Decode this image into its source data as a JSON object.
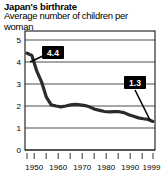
{
  "title": "Japan's birthrate",
  "subtitle": "Average number of children per woman",
  "chart_data": {
    "type": "line",
    "title": "Japan's birthrate",
    "subtitle": "Average number of children per woman",
    "xlabel": "",
    "ylabel": "",
    "xlim": [
      1946,
      2000
    ],
    "ylim": [
      0,
      5.4
    ],
    "grid": true,
    "legend": null,
    "y_ticks": [
      "5",
      "4",
      "3",
      "2",
      "1",
      "0"
    ],
    "y_tick_values": [
      5,
      4,
      3,
      2,
      1,
      0
    ],
    "x_ticks": [
      "1950",
      "1960",
      "1970",
      "1980",
      "1990",
      "1999"
    ],
    "x_tick_values": [
      1950,
      1960,
      1970,
      1980,
      1990,
      1999
    ],
    "x_minor_ticks": [
      1947,
      1950,
      1955,
      1960,
      1965,
      1970,
      1975,
      1980,
      1985,
      1990,
      1995,
      1999
    ],
    "x": [
      1947,
      1949,
      1951,
      1953,
      1955,
      1957,
      1959,
      1961,
      1963,
      1965,
      1967,
      1969,
      1971,
      1973,
      1975,
      1977,
      1979,
      1981,
      1983,
      1985,
      1987,
      1989,
      1991,
      1993,
      1995,
      1997,
      1999
    ],
    "values": [
      4.4,
      4.3,
      3.6,
      3.1,
      2.4,
      2.05,
      2.0,
      1.96,
      2.0,
      2.05,
      2.07,
      2.05,
      2.02,
      1.95,
      1.85,
      1.8,
      1.75,
      1.73,
      1.74,
      1.74,
      1.7,
      1.6,
      1.53,
      1.46,
      1.42,
      1.39,
      1.3
    ],
    "series": [
      {
        "name": "Japan total fertility rate",
        "values": [
          4.4,
          4.3,
          3.6,
          3.1,
          2.4,
          2.05,
          2.0,
          1.96,
          2.0,
          2.05,
          2.07,
          2.05,
          2.02,
          1.95,
          1.85,
          1.8,
          1.75,
          1.73,
          1.74,
          1.74,
          1.7,
          1.6,
          1.53,
          1.46,
          1.42,
          1.39,
          1.3
        ],
        "color": "#2b2b2b"
      }
    ],
    "annotations": [
      {
        "label": "4.4",
        "x": 1947,
        "y": 4.4
      },
      {
        "label": "1.3",
        "x": 1999,
        "y": 1.3
      }
    ]
  },
  "callouts": {
    "start": "4.4",
    "end": "1.3"
  }
}
